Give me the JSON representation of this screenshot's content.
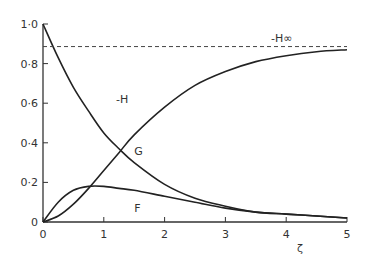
{
  "chart_data": {
    "type": "line",
    "title": "",
    "xlabel": "ζ",
    "ylabel": "",
    "xlim": [
      0,
      5
    ],
    "ylim": [
      0,
      1.0
    ],
    "grid": false,
    "legend": "inline curve labels",
    "x_ticks": [
      0,
      1,
      2,
      3,
      4,
      5
    ],
    "x_tick_labels": [
      "0",
      "1",
      "2",
      "3",
      "4",
      "5"
    ],
    "y_ticks": [
      0,
      0.2,
      0.4,
      0.6,
      0.8,
      1.0
    ],
    "y_tick_labels": [
      "0",
      "0·2",
      "0·4",
      "0·6",
      "0·8",
      "1·0"
    ],
    "series": [
      {
        "name": "-H",
        "x": [
          0,
          0.25,
          0.5,
          0.75,
          1.0,
          1.25,
          1.5,
          2.0,
          2.5,
          3.0,
          3.5,
          4.0,
          4.5,
          5.0
        ],
        "values": [
          0,
          0.03,
          0.09,
          0.17,
          0.26,
          0.35,
          0.44,
          0.58,
          0.69,
          0.76,
          0.81,
          0.84,
          0.86,
          0.87
        ]
      },
      {
        "name": "G",
        "x": [
          0,
          0.25,
          0.5,
          0.75,
          1.0,
          1.25,
          1.5,
          2.0,
          2.5,
          3.0,
          3.5,
          4.0,
          4.5,
          5.0
        ],
        "values": [
          1.0,
          0.83,
          0.68,
          0.56,
          0.45,
          0.37,
          0.3,
          0.19,
          0.12,
          0.08,
          0.05,
          0.04,
          0.03,
          0.02
        ]
      },
      {
        "name": "F",
        "x": [
          0,
          0.25,
          0.5,
          0.75,
          1.0,
          1.25,
          1.5,
          2.0,
          2.5,
          3.0,
          3.5,
          4.0,
          4.5,
          5.0
        ],
        "values": [
          0,
          0.1,
          0.16,
          0.18,
          0.18,
          0.17,
          0.16,
          0.13,
          0.1,
          0.07,
          0.05,
          0.04,
          0.03,
          0.02
        ]
      },
      {
        "name": "-H∞",
        "style": "dashed",
        "x": [
          0,
          5
        ],
        "values": [
          0.886,
          0.886
        ]
      }
    ],
    "annotations": [
      {
        "text": "-H∞",
        "x": 3.75,
        "y": 0.91
      },
      {
        "text": "-H",
        "x": 1.2,
        "y": 0.6
      },
      {
        "text": "G",
        "x": 1.5,
        "y": 0.34
      },
      {
        "text": "F",
        "x": 1.5,
        "y": 0.05
      }
    ]
  }
}
